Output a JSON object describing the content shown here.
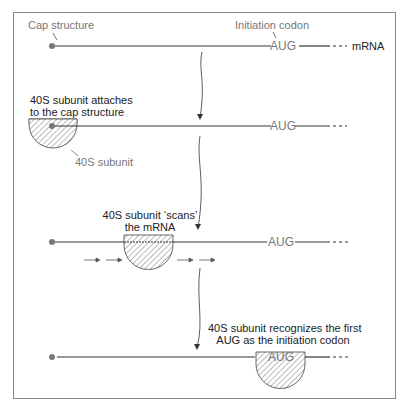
{
  "labels": {
    "cap_structure": "Cap structure",
    "initiation_codon": "Initiation codon",
    "mrna": "mRNA",
    "codon": "AUG",
    "subunit": "40S subunit"
  },
  "steps": [
    {
      "caption_line1": "40S subunit attaches",
      "caption_line2": "to the cap structure"
    },
    {
      "caption_line1": "40S subunit ‘scans’",
      "caption_line2": "the mRNA"
    },
    {
      "caption_line1": "40S subunit recognizes the first",
      "caption_line2": "AUG as the initiation codon"
    }
  ],
  "colors": {
    "line": "#333333",
    "cap_dot": "#777777",
    "text_gray": "#777777",
    "hatch": "#666666"
  }
}
